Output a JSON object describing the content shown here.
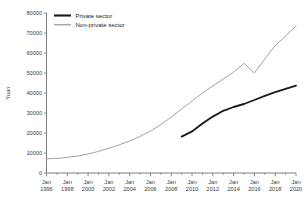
{
  "chart_data": {
    "type": "line",
    "title": "",
    "xlabel": "",
    "ylabel": "Yuan",
    "ylim": [
      0,
      80000
    ],
    "xlim": [
      1996,
      2020
    ],
    "grid": false,
    "legend_position": "top-left",
    "y_ticks": [
      0,
      10000,
      20000,
      30000,
      40000,
      50000,
      60000,
      70000,
      80000
    ],
    "y_tick_labels": [
      "0",
      "10000",
      "20000",
      "30000",
      "40000",
      "50000",
      "60000",
      "70000",
      "80000"
    ],
    "x_ticks": [
      1996,
      1998,
      2000,
      2002,
      2004,
      2006,
      2008,
      2010,
      2012,
      2014,
      2016,
      2018,
      2020
    ],
    "x_tick_labels": [
      [
        "Jan",
        "1996"
      ],
      [
        "Jan",
        "1998"
      ],
      [
        "Jan",
        "2000"
      ],
      [
        "Jan",
        "2002"
      ],
      [
        "Jan",
        "2004"
      ],
      [
        "Jan",
        "2006"
      ],
      [
        "Jan",
        "2008"
      ],
      [
        "Jan",
        "2010"
      ],
      [
        "Jan",
        "2012"
      ],
      [
        "Jan",
        "2014"
      ],
      [
        "Jan",
        "2016"
      ],
      [
        "Jan",
        "2018"
      ],
      [
        "Jan",
        "2020"
      ]
    ],
    "x_minor_tick_years": [
      1997,
      1999,
      2001,
      2003,
      2005,
      2007,
      2009,
      2011,
      2013,
      2015,
      2017,
      2019
    ],
    "series": [
      {
        "name": "Private sector",
        "color": "#1a1a1a",
        "x": [
          2009,
          2010,
          2011,
          2012,
          2013,
          2014,
          2015,
          2016,
          2017,
          2018,
          2019,
          2020
        ],
        "values": [
          18200,
          20800,
          24700,
          28200,
          31100,
          33000,
          34500,
          36500,
          38600,
          40400,
          42100,
          43700
        ]
      },
      {
        "name": "Non-private sector",
        "color": "#a3a3a3",
        "x": [
          1996,
          1997,
          1998,
          1999,
          2000,
          2001,
          2002,
          2003,
          2004,
          2005,
          2006,
          2007,
          2008,
          2009,
          2010,
          2011,
          2012,
          2013,
          2014,
          2015,
          2016,
          2017,
          2018,
          2019,
          2020
        ],
        "values": [
          7100,
          7300,
          7800,
          8500,
          9500,
          10800,
          12400,
          14100,
          16000,
          18300,
          21000,
          24200,
          28000,
          32000,
          36000,
          40000,
          43500,
          47000,
          50500,
          54800,
          50000,
          57000,
          63800,
          68500,
          73500
        ]
      }
    ]
  },
  "legend": {
    "entries": [
      {
        "label": "Private sector"
      },
      {
        "label": "Non-private sector"
      }
    ]
  },
  "axes": {
    "y_axis_title": "Yuan"
  }
}
